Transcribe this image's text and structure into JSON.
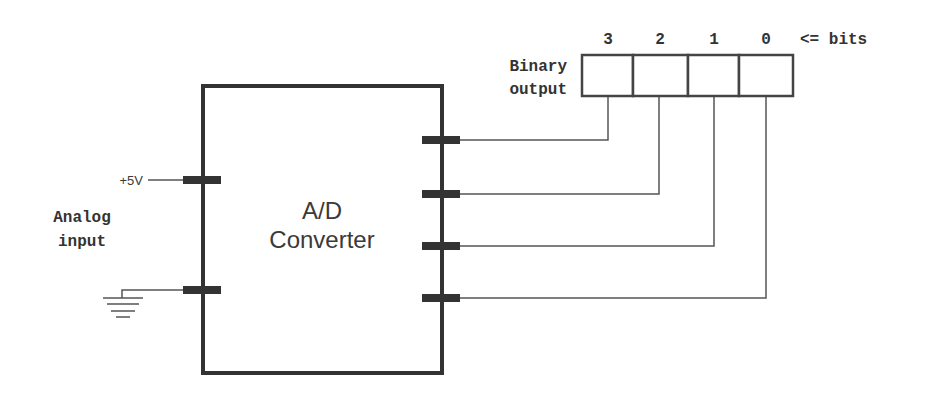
{
  "diagram": {
    "title": "A/D Converter",
    "converter": {
      "line1": "A/D",
      "line2": "Converter"
    },
    "inputs": {
      "supply_label": "+5V",
      "analog_label_line1": "Analog",
      "analog_label_line2": "input",
      "ground": "ground-symbol"
    },
    "output": {
      "label_line1": "Binary",
      "label_line2": "output",
      "bits_suffix": "<= bits",
      "bits": [
        "3",
        "2",
        "1",
        "0"
      ]
    },
    "colors": {
      "stroke": "#333333",
      "wire": "#555555",
      "background": "#ffffff"
    }
  }
}
